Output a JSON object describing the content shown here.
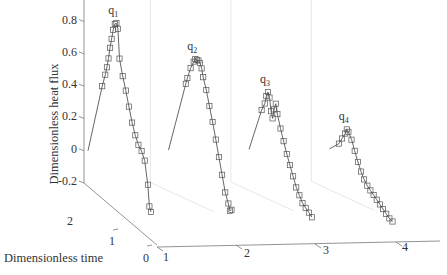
{
  "chart_data": {
    "type": "line",
    "subtype": "3d-waterfall",
    "title": "",
    "ylabel": "Dimensionless heat flux",
    "xlabel": "Dimensionless time",
    "zlabel": "",
    "ylim": [
      -0.2,
      1
    ],
    "y_ticks": [
      "-0.2",
      "0",
      "0.2",
      "0.4",
      "0.6",
      "0.8",
      "1"
    ],
    "time_ticks": [
      "0",
      "1",
      "2"
    ],
    "index_ticks": [
      "1",
      "2",
      "3",
      "4"
    ],
    "grid": false,
    "legend": null,
    "marker": "square (data), solid line (fit)",
    "series": [
      {
        "name": "q1",
        "label_main": "q",
        "label_sub": "1",
        "index": 1,
        "time": [
          2.0,
          1.55,
          1.45,
          1.4,
          1.35,
          1.3,
          1.25,
          1.2,
          1.15,
          1.1,
          1.05,
          1.0,
          0.9,
          0.8,
          0.7,
          0.6,
          0.5,
          0.4,
          0.3,
          0.2,
          0.1,
          0.05,
          0.0
        ],
        "values": [
          0.0,
          0.44,
          0.52,
          0.57,
          0.63,
          0.7,
          0.76,
          0.82,
          0.86,
          0.87,
          0.84,
          0.66,
          0.56,
          0.48,
          0.39,
          0.3,
          0.23,
          0.18,
          0.15,
          0.1,
          -0.04,
          -0.17,
          -0.2
        ]
      },
      {
        "name": "q2",
        "label_main": "q",
        "label_sub": "2",
        "index": 2,
        "time": [
          2.0,
          1.45,
          1.4,
          1.3,
          1.2,
          1.15,
          1.1,
          1.05,
          1.0,
          0.95,
          0.9,
          0.8,
          0.7,
          0.6,
          0.5,
          0.4,
          0.3,
          0.2,
          0.1,
          0.05,
          0.0
        ],
        "values": [
          0.0,
          0.46,
          0.5,
          0.57,
          0.62,
          0.64,
          0.64,
          0.64,
          0.63,
          0.6,
          0.55,
          0.48,
          0.39,
          0.3,
          0.2,
          0.1,
          0.0,
          -0.1,
          -0.16,
          -0.2,
          -0.19
        ]
      },
      {
        "name": "q3",
        "label_main": "q",
        "label_sub": "3",
        "index": 3,
        "time": [
          2.0,
          1.6,
          1.5,
          1.45,
          1.4,
          1.35,
          1.3,
          1.25,
          1.2,
          1.15,
          1.1,
          1.0,
          0.9,
          0.8,
          0.7,
          0.6,
          0.5,
          0.4,
          0.3,
          0.2,
          0.1,
          0.0
        ],
        "values": [
          0.0,
          0.28,
          0.33,
          0.38,
          0.41,
          0.38,
          0.3,
          0.26,
          0.32,
          0.36,
          0.3,
          0.22,
          0.15,
          0.08,
          0.02,
          -0.04,
          -0.1,
          -0.14,
          -0.18,
          -0.2,
          -0.22,
          -0.24
        ]
      },
      {
        "name": "q4",
        "label_main": "q",
        "label_sub": "4",
        "index": 4,
        "time": [
          2.0,
          1.7,
          1.6,
          1.5,
          1.45,
          1.4,
          1.3,
          1.2,
          1.1,
          1.0,
          0.9,
          0.8,
          0.7,
          0.6,
          0.5,
          0.4,
          0.3,
          0.2,
          0.1,
          0.0
        ],
        "values": [
          0.0,
          0.06,
          0.1,
          0.14,
          0.17,
          0.16,
          0.12,
          0.06,
          0.0,
          -0.05,
          -0.09,
          -0.12,
          -0.14,
          -0.16,
          -0.18,
          -0.2,
          -0.22,
          -0.24,
          -0.26,
          -0.27
        ]
      }
    ]
  },
  "colors": {
    "line": "#555555",
    "marker": "#555555",
    "axis": "#777777",
    "panel": "#dddddd"
  }
}
